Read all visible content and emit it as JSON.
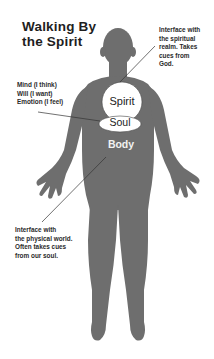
{
  "title": {
    "line1": "Walking By",
    "line2": "the Spirit"
  },
  "figure": {
    "silhouette_color": "#6e6e6e",
    "region_fill": "#ffffff",
    "line_color": "#333333"
  },
  "regions": {
    "spirit": {
      "label": "Spirit"
    },
    "soul": {
      "label": "Soul"
    },
    "body": {
      "label": "Body"
    }
  },
  "annotations": {
    "spirit": {
      "lines": [
        "Interface with",
        "the spiritual",
        "realm. Takes",
        "cues from",
        "God."
      ]
    },
    "soul": {
      "lines": [
        "Mind (I think)",
        "Will (I want)",
        "Emotion (I feel)"
      ]
    },
    "body": {
      "lines": [
        "Interface with",
        "the physical world.",
        "Often takes cues",
        "from our soul."
      ]
    }
  }
}
